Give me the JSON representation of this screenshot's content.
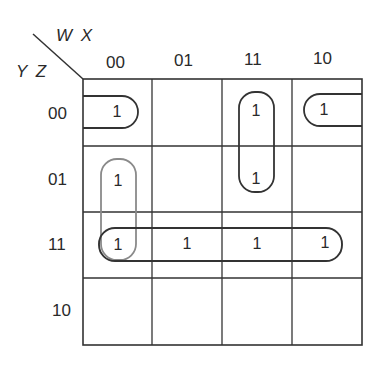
{
  "kmap": {
    "col_var": "W X",
    "row_var": "Y Z",
    "col_labels": [
      "00",
      "01",
      "11",
      "10"
    ],
    "row_labels": [
      "00",
      "01",
      "11",
      "10"
    ],
    "cells": [
      [
        "1",
        "",
        "1",
        "1"
      ],
      [
        "1",
        "",
        "1",
        ""
      ],
      [
        "1",
        "1",
        "1",
        "1"
      ],
      [
        "",
        "",
        "",
        ""
      ]
    ],
    "groups": [
      {
        "name": "row00-wrap-cols-00-10",
        "cells": [
          [
            0,
            0
          ],
          [
            0,
            3
          ]
        ],
        "wraps": true
      },
      {
        "name": "col11-rows-00-01",
        "cells": [
          [
            0,
            2
          ],
          [
            1,
            2
          ]
        ]
      },
      {
        "name": "col00-rows-01-11",
        "cells": [
          [
            1,
            0
          ],
          [
            2,
            0
          ]
        ],
        "color": "#888888"
      },
      {
        "name": "row11-all",
        "cells": [
          [
            2,
            0
          ],
          [
            2,
            1
          ],
          [
            2,
            2
          ],
          [
            2,
            3
          ]
        ]
      }
    ],
    "colors": {
      "line": "#333333",
      "group": "#333333",
      "group_light": "#8a8a8a"
    }
  }
}
